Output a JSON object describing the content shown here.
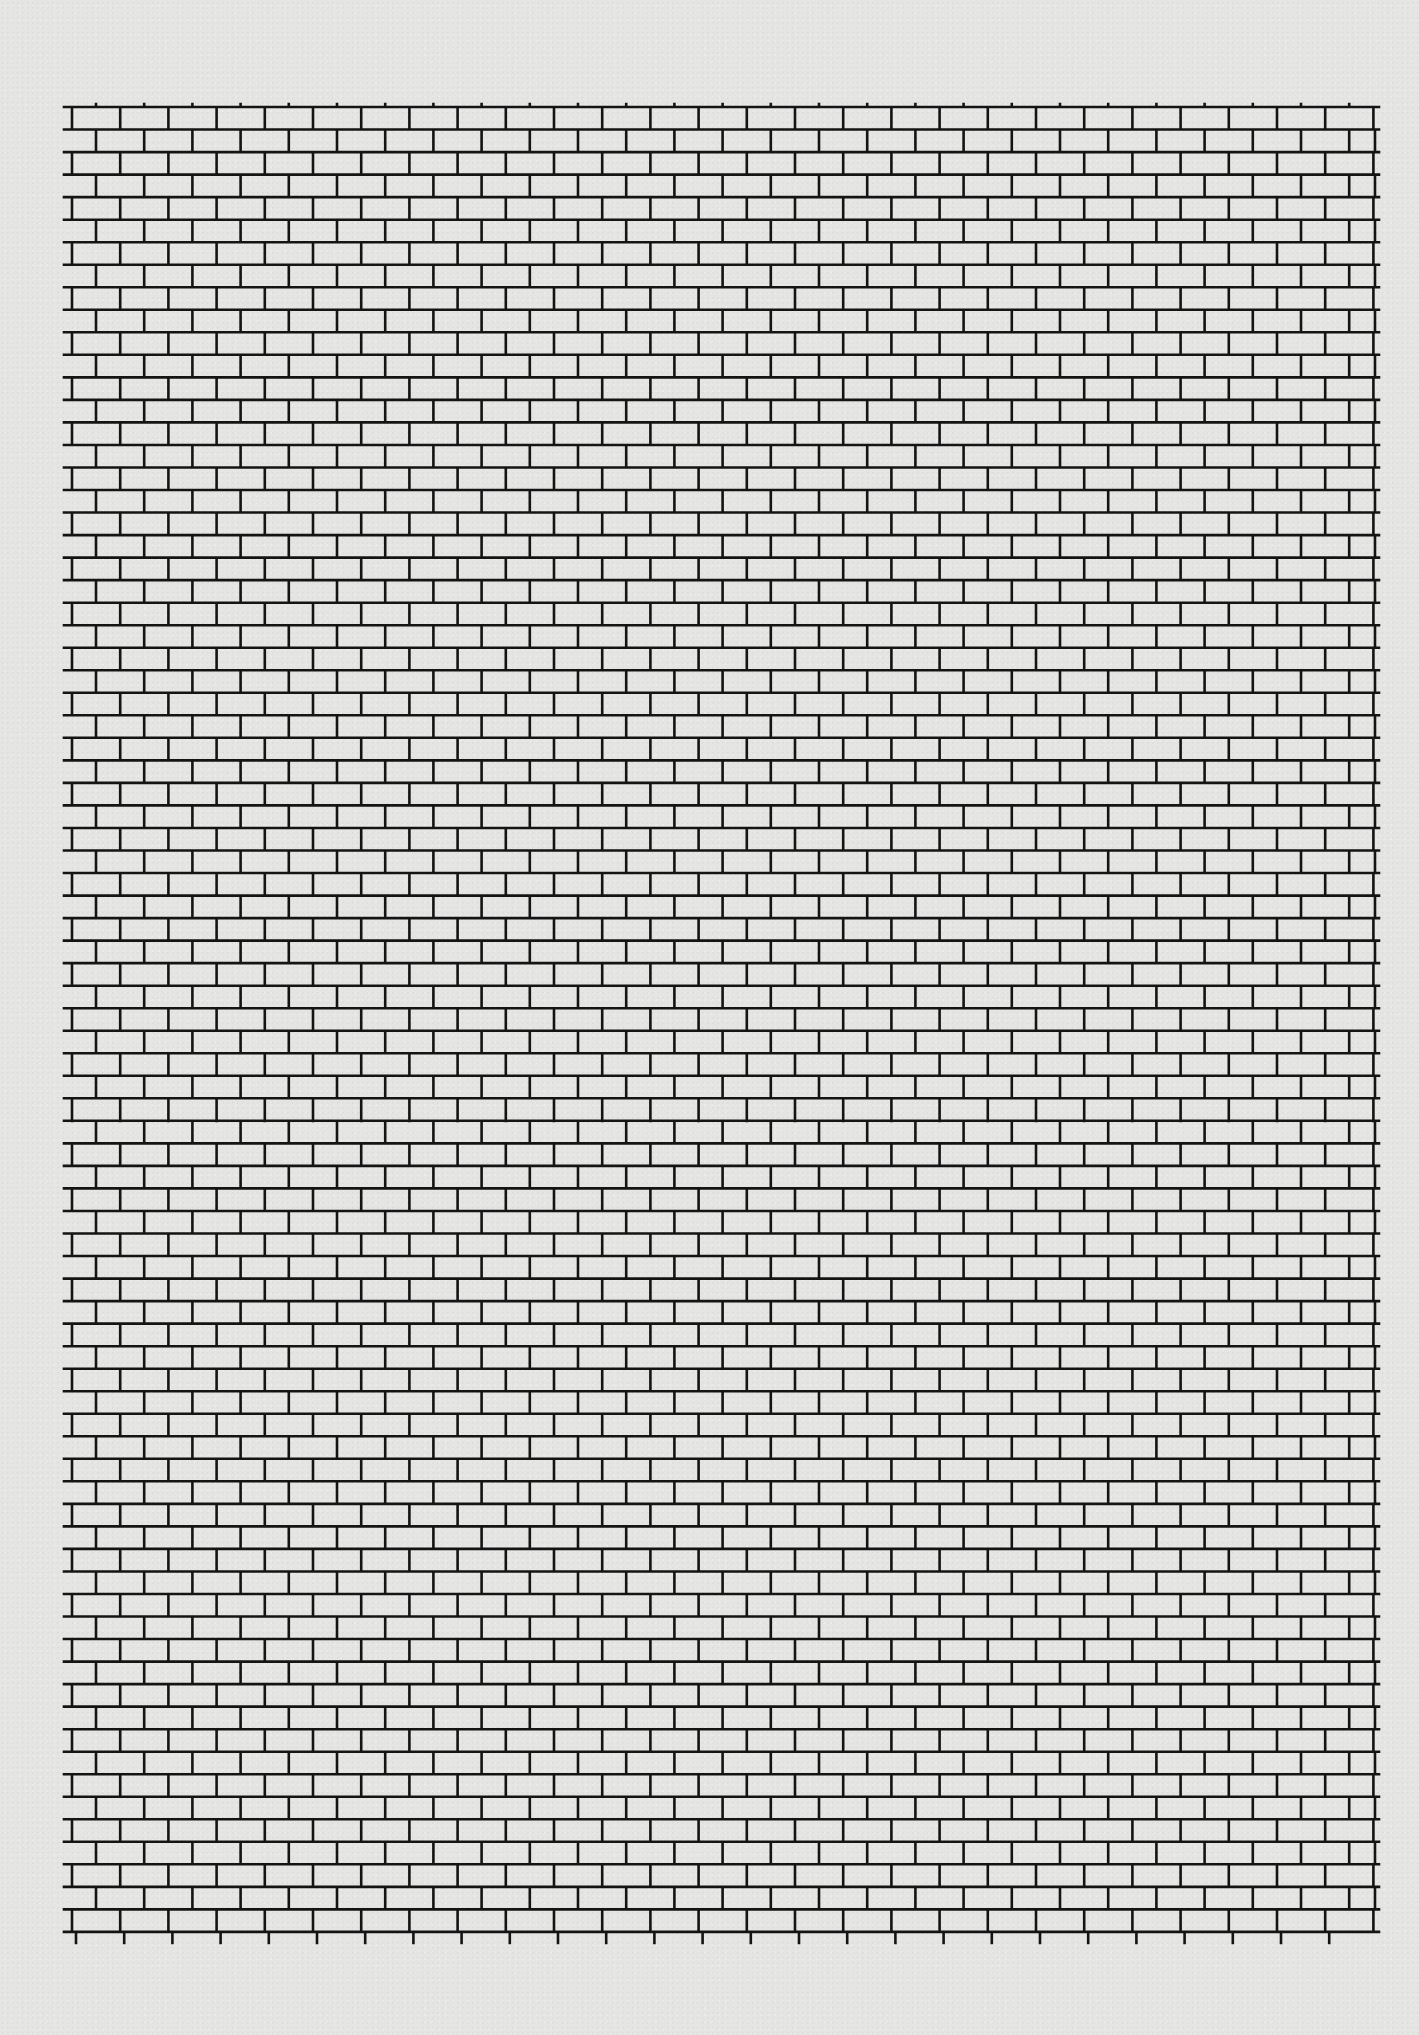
{
  "page": {
    "type": "brick-pattern graph paper",
    "background_color": "#e5e5e4",
    "line_color": "#141414"
  },
  "grid": {
    "left": 64,
    "right": 1379,
    "top": 107,
    "rows": 81,
    "row_height": 22.53,
    "brick_width": 48.2,
    "odd_row_first_vertical_x": 72,
    "even_row_first_vertical_x": 96,
    "even_row_closing_vertical_x": 1375,
    "line_width": 2.6,
    "bottom_tick_length": 11,
    "top_tick_length": 3
  }
}
